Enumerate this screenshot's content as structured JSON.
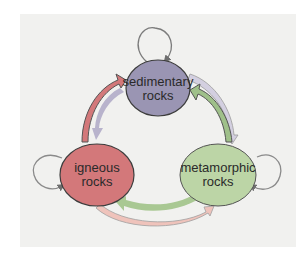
{
  "diagram": {
    "type": "cycle",
    "nodes": [
      {
        "id": "sedimentary",
        "line1": "sedimentary",
        "line2": "rocks",
        "color": "#9a95b3"
      },
      {
        "id": "igneous",
        "line1": "igneous",
        "line2": "rocks",
        "color": "#d3787a"
      },
      {
        "id": "metamorphic",
        "line1": "metamorphic",
        "line2": "rocks",
        "color": "#bcd5a6"
      }
    ],
    "edges": [
      {
        "from": "igneous",
        "to": "sedimentary",
        "color": "#d3787a"
      },
      {
        "from": "sedimentary",
        "to": "igneous",
        "color": "#b4afc9"
      },
      {
        "from": "sedimentary",
        "to": "metamorphic",
        "color": "#cfc9de"
      },
      {
        "from": "metamorphic",
        "to": "sedimentary",
        "color": "#bcd5a6"
      },
      {
        "from": "metamorphic",
        "to": "igneous",
        "color": "#bcd5a6"
      },
      {
        "from": "igneous",
        "to": "metamorphic",
        "color": "#e9b7b1"
      },
      {
        "from": "sedimentary",
        "to": "sedimentary",
        "type": "self-loop"
      },
      {
        "from": "igneous",
        "to": "igneous",
        "type": "self-loop"
      },
      {
        "from": "metamorphic",
        "to": "metamorphic",
        "type": "self-loop"
      }
    ]
  }
}
